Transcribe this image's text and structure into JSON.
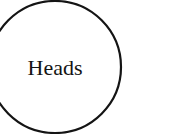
{
  "diagram": {
    "node": {
      "label": "Heads",
      "shape": "circle",
      "stroke_color": "#141414",
      "fill_color": "#ffffff"
    }
  }
}
